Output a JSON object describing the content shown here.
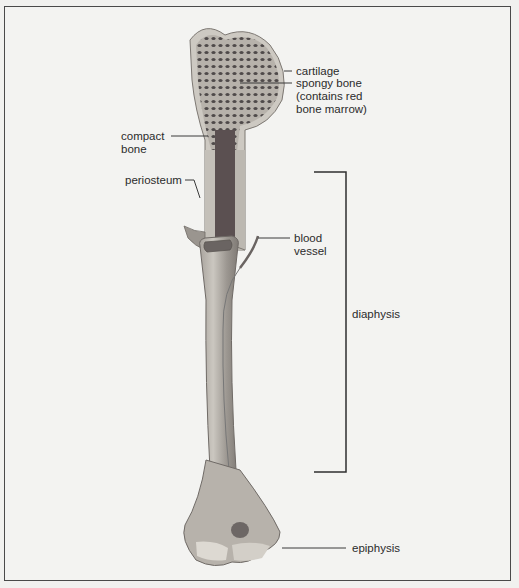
{
  "figure": {
    "labels": {
      "cartilage": "cartilage",
      "spongy_bone": "spongy bone\n(contains red\nbone marrow)",
      "compact_bone": "compact\nbone",
      "periosteum": "periosteum",
      "blood_vessel": "blood\nvessel",
      "diaphysis": "diaphysis",
      "epiphysis": "epiphysis"
    },
    "colors": {
      "background": "#f3f3f1",
      "frame": "#4a4a4a",
      "bone_light": "#c9c5bd",
      "bone_dark": "#6f6a66",
      "marrow": "#5a4f50",
      "leader_line": "#3a3a3a"
    }
  }
}
